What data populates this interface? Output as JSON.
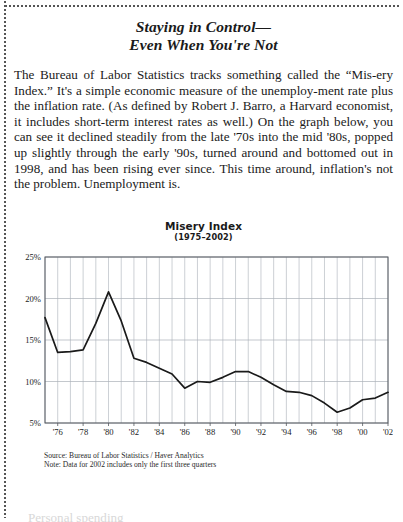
{
  "article": {
    "headline_line1": "Staying in Control—",
    "headline_line2": "Even When You're Not",
    "body": "The Bureau of Labor Statistics tracks something called the “Mis-ery Index.” It's a simple economic measure of the unemploy-ment rate plus the inflation rate. (As defined by Robert J. Barro, a Harvard economist, it includes short-term interest rates as well.) On the graph below, you can see it declined steadily from the late '70s into the mid '80s, popped up slightly through the early '90s, turned around and bottomed out in 1998, and has been rising ever since. This time around, inflation's not the problem. Unemployment is.",
    "tail_fragment": "Personal spending"
  },
  "chart_data": {
    "type": "line",
    "title": "Misery Index",
    "subtitle": "(1975–2002)",
    "xlabel": "",
    "ylabel": "",
    "ylim": [
      5,
      25
    ],
    "xlim": [
      1975,
      2002
    ],
    "grid": true,
    "legend": "none",
    "ytick_labels": [
      "25%",
      "20%",
      "15%",
      "10%",
      "5%"
    ],
    "ytick_values": [
      25,
      20,
      15,
      10,
      5
    ],
    "xtick_labels": [
      "'76",
      "'78",
      "'80",
      "'82",
      "'84",
      "'86",
      "'88",
      "'90",
      "'92",
      "'94",
      "'96",
      "'98",
      "'00",
      "'02"
    ],
    "xtick_values": [
      1976,
      1978,
      1980,
      1982,
      1984,
      1986,
      1988,
      1990,
      1992,
      1994,
      1996,
      1998,
      2000,
      2002
    ],
    "x": [
      1975,
      1976,
      1977,
      1978,
      1979,
      1980,
      1981,
      1982,
      1983,
      1984,
      1985,
      1986,
      1987,
      1988,
      1989,
      1990,
      1991,
      1992,
      1993,
      1994,
      1995,
      1996,
      1997,
      1998,
      1999,
      2000,
      2001,
      2002
    ],
    "values": [
      17.7,
      13.5,
      13.6,
      13.8,
      17.0,
      20.8,
      17.3,
      12.8,
      12.3,
      11.6,
      10.9,
      9.2,
      10.0,
      9.9,
      10.5,
      11.2,
      11.2,
      10.5,
      9.6,
      8.8,
      8.7,
      8.3,
      7.4,
      6.3,
      6.8,
      7.8,
      8.0,
      8.7
    ],
    "line_color": "#1a1a1a",
    "grid_color": "#aab0b8",
    "axis_color": "#55595e",
    "source_note": "Source: Bureau of Labor Statistics / Haver Analytics",
    "data_note": "Note: Data for 2002 includes only the first three quarters"
  }
}
